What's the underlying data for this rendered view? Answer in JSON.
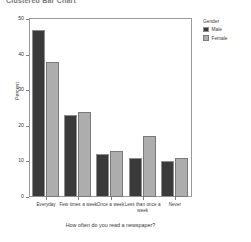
{
  "chart_data": {
    "type": "bar",
    "title": "Clustered Bar Chart",
    "xlabel": "How often do you read a newspaper?",
    "ylabel": "Percent",
    "categories": [
      "Everyday",
      "Few times a week",
      "Once a week",
      "Less than once a week",
      "Never"
    ],
    "series": [
      {
        "name": "Male",
        "values": [
          47,
          23,
          12,
          11,
          10
        ],
        "color": "#3a3a3a"
      },
      {
        "name": "Female",
        "values": [
          38,
          24,
          13,
          17,
          11
        ],
        "color": "#adadad"
      }
    ],
    "ylim": [
      0,
      50
    ],
    "yticks": [
      0,
      10,
      20,
      30,
      40,
      50
    ],
    "ytick_labels": [
      "0",
      "10",
      "20",
      "30",
      "40",
      "50"
    ],
    "grid": false,
    "legend_position": "right",
    "legend_title": "Gender"
  }
}
